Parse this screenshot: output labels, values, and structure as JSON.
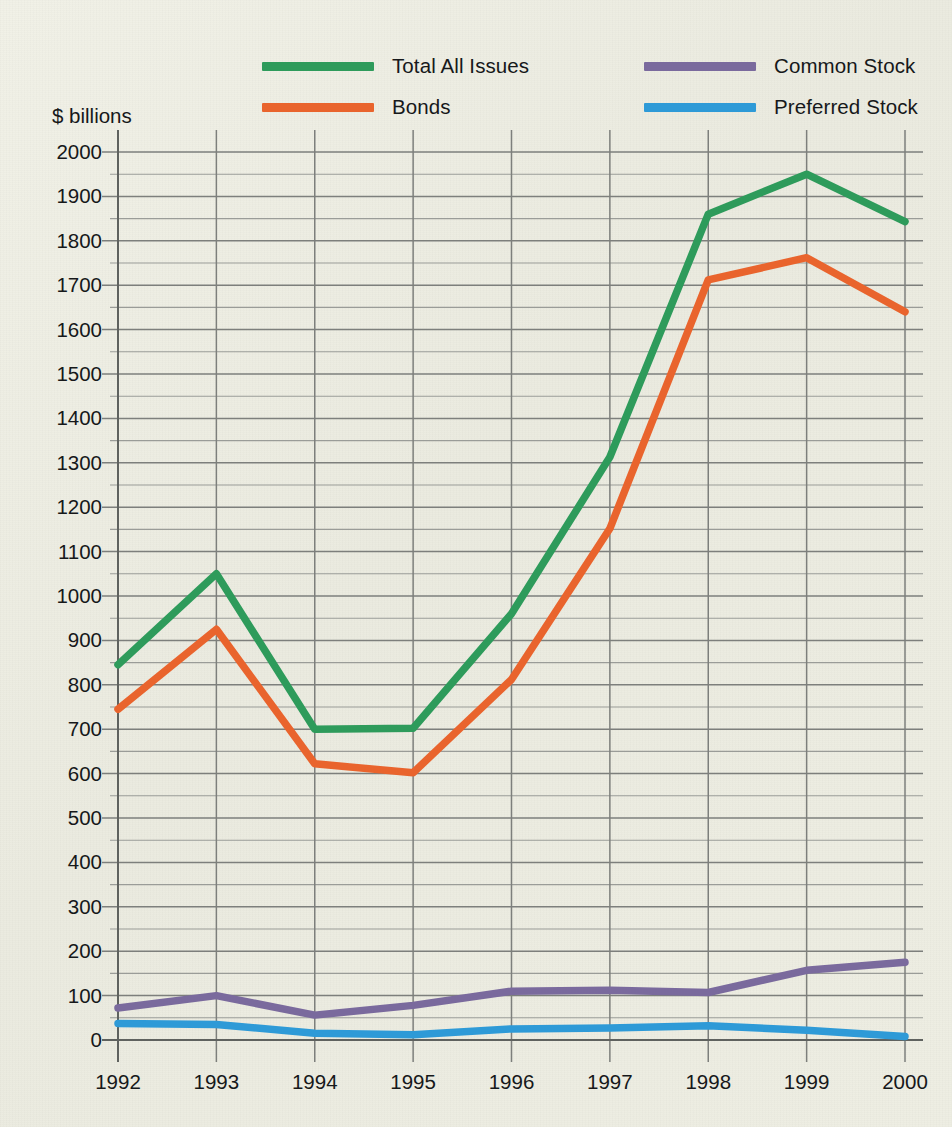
{
  "chart_data": {
    "type": "line",
    "title": "",
    "xlabel": "",
    "ylabel": "$ billions",
    "ylim": [
      0,
      2000
    ],
    "ytick_step": 100,
    "yminor_step": 50,
    "grid": true,
    "legend_position": "top",
    "categories": [
      "1992",
      "1993",
      "1994",
      "1995",
      "1996",
      "1997",
      "1998",
      "1999",
      "2000"
    ],
    "x": [
      1992,
      1993,
      1994,
      1995,
      1996,
      1997,
      1998,
      1999,
      2000
    ],
    "yticks": [
      0,
      100,
      200,
      300,
      400,
      500,
      600,
      700,
      800,
      900,
      1000,
      1100,
      1200,
      1300,
      1400,
      1500,
      1600,
      1700,
      1800,
      1900,
      2000
    ],
    "series": [
      {
        "name": "Total All Issues",
        "color": "#2e9b5b",
        "values": [
          845,
          1050,
          700,
          702,
          960,
          1313,
          1860,
          1950,
          1843
        ]
      },
      {
        "name": "Bonds",
        "color": "#e9642d",
        "values": [
          745,
          925,
          622,
          602,
          812,
          1152,
          1712,
          1762,
          1640
        ]
      },
      {
        "name": "Common Stock",
        "color": "#7a6a9d",
        "values": [
          72,
          100,
          56,
          78,
          110,
          112,
          107,
          157,
          175
        ]
      },
      {
        "name": "Preferred Stock",
        "color": "#2e9ad7",
        "values": [
          37,
          35,
          15,
          12,
          25,
          27,
          32,
          22,
          8
        ]
      }
    ]
  },
  "legend": {
    "items": [
      {
        "label": "Total All Issues"
      },
      {
        "label": "Bonds"
      },
      {
        "label": "Common Stock"
      },
      {
        "label": "Preferred Stock"
      }
    ]
  },
  "axis": {
    "y_title": "$ billions"
  },
  "colors": {
    "background": "#eeeee3",
    "grid_major": "#7d7f7c",
    "grid_minor": "#9a9c98",
    "axis": "#5f625f",
    "text": "#16181a",
    "total_all_issues": "#2e9b5b",
    "bonds": "#e9642d",
    "common_stock": "#7a6a9d",
    "preferred_stock": "#2e9ad7"
  }
}
